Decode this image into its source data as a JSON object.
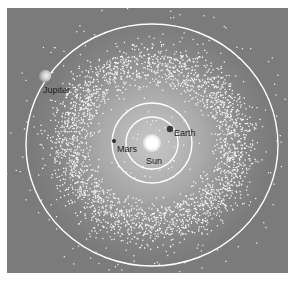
{
  "diagram": {
    "title": "",
    "colors": {
      "background": "#7b7b7b",
      "inner_glow": "#b4b4b4",
      "orbit": "#ffffff",
      "asteroid": "#f4f4f4",
      "label": "#1e1e1e"
    },
    "sun": {
      "label": "Sun",
      "cx": 152,
      "cy": 143
    },
    "bodies": [
      {
        "name": "Earth",
        "label": "Earth",
        "orbit_radius": 26
      },
      {
        "name": "Mars",
        "label": "Mars",
        "orbit_radius": 40
      },
      {
        "name": "Jupiter",
        "label": "Jupiter",
        "orbit_rx": 126,
        "orbit_ry": 121
      }
    ],
    "asteroid_belt": {
      "inner_radius": 48,
      "outer_radius": 110
    }
  }
}
